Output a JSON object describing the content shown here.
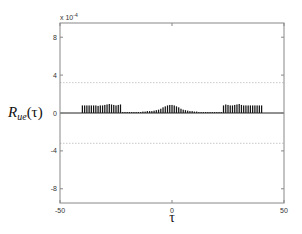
{
  "chart_data": {
    "type": "bar",
    "title": "",
    "xlabel": "τ",
    "ylabel": "R_ue(τ)",
    "ylabel_main": "R",
    "ylabel_sub": "ue",
    "ylabel_arg": "(τ)",
    "y_multiplier": "x 10",
    "y_exponent": "-4",
    "xlim": [
      -50,
      50
    ],
    "ylim": [
      -9.5,
      9.5
    ],
    "xticks": [
      -50,
      0,
      50
    ],
    "yticks": [
      8,
      4,
      0,
      -4,
      -8
    ],
    "confidence_bounds": [
      3.2,
      -3.2
    ],
    "grid": false,
    "x": [
      -40,
      -39,
      -38,
      -37,
      -36,
      -35,
      -34,
      -33,
      -32,
      -31,
      -30,
      -29,
      -28,
      -27,
      -26,
      -25,
      -24,
      -23,
      -22,
      -21,
      -20,
      -19,
      -18,
      -17,
      -16,
      -15,
      -14,
      -13,
      -12,
      -11,
      -10,
      -9,
      -8,
      -7,
      -6,
      -5,
      -4,
      -3,
      -2,
      -1,
      0,
      1,
      2,
      3,
      4,
      5,
      6,
      7,
      8,
      9,
      10,
      11,
      12,
      13,
      14,
      15,
      16,
      17,
      18,
      19,
      20,
      21,
      22,
      23,
      24,
      25,
      26,
      27,
      28,
      29,
      30,
      31,
      32,
      33,
      34,
      35,
      36,
      37,
      38,
      39,
      40
    ],
    "values": [
      0.8,
      0.8,
      0.8,
      0.8,
      0.8,
      0.8,
      0.8,
      0.75,
      0.8,
      0.8,
      0.85,
      0.9,
      0.95,
      0.9,
      0.85,
      0.8,
      0.85,
      0.9,
      0.1,
      0.1,
      0.1,
      0.1,
      0.1,
      0.1,
      0.1,
      0.1,
      0.1,
      0.15,
      0.15,
      0.2,
      0.2,
      0.2,
      0.25,
      0.3,
      0.35,
      0.45,
      0.6,
      0.7,
      0.8,
      0.85,
      0.85,
      0.8,
      0.7,
      0.6,
      0.45,
      0.35,
      0.3,
      0.25,
      0.2,
      0.2,
      0.15,
      0.15,
      0.1,
      0.1,
      0.1,
      0.1,
      0.1,
      0.1,
      0.1,
      0.1,
      0.1,
      0.1,
      0.1,
      0.8,
      0.9,
      0.85,
      0.8,
      0.8,
      0.85,
      0.9,
      0.95,
      0.85,
      0.8,
      0.8,
      0.8,
      0.8,
      0.8,
      0.8,
      0.8,
      0.8,
      0.8
    ]
  }
}
